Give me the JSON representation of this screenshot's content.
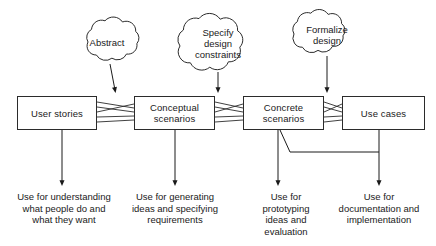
{
  "diagram": {
    "stroke_color": "#2b2b2b",
    "text_color": "#1a1a1a",
    "background_color": "#ffffff",
    "boxes": [
      {
        "id": "user-stories",
        "label": "User stories",
        "x": 17,
        "y": 96,
        "w": 80,
        "h": 34
      },
      {
        "id": "conceptual-scenarios",
        "label": "Conceptual\nscenarios",
        "x": 134,
        "y": 96,
        "w": 81,
        "h": 34
      },
      {
        "id": "concrete-scenarios",
        "label": "Concrete\nscenarios",
        "x": 243,
        "y": 96,
        "w": 81,
        "h": 34
      },
      {
        "id": "use-cases",
        "label": "Use cases",
        "x": 342,
        "y": 96,
        "w": 83,
        "h": 34
      }
    ],
    "clouds": [
      {
        "id": "abstract",
        "label": "Abstract",
        "cx": 107,
        "cy": 42,
        "rx": 35,
        "ry": 22
      },
      {
        "id": "specify-design",
        "label": "Specify\ndesign\nconstraints",
        "cx": 218,
        "cy": 43,
        "rx": 40,
        "ry": 29
      },
      {
        "id": "formalize-design",
        "label": "Formalize\ndesign",
        "cx": 327,
        "cy": 34,
        "rx": 36,
        "ry": 22
      }
    ],
    "captions": [
      {
        "id": "use-understanding",
        "text": "Use for understanding\nwhat people do and\nwhat they want",
        "cx": 62,
        "y": 191,
        "w": 128
      },
      {
        "id": "use-generating",
        "text": "Use for generating\nideas and specifying\nrequirements",
        "cx": 175,
        "y": 191,
        "w": 118
      },
      {
        "id": "use-prototyping",
        "text": "Use for\nprototyping\nideas and\nevaluation",
        "cx": 286,
        "y": 191,
        "w": 76
      },
      {
        "id": "use-documentation",
        "text": "Use for\ndocumentation and\nimplementation",
        "cx": 379,
        "y": 191,
        "w": 112
      }
    ],
    "connector_label": "many-to-many fan connector",
    "arrows": [
      {
        "id": "abstract-to-conceptual",
        "from": "abstract",
        "to": "conceptual-scenarios"
      },
      {
        "id": "specify-to-concrete",
        "from": "specify-design",
        "to": "concrete-scenarios"
      },
      {
        "id": "formalize-to-use-cases",
        "from": "formalize-design",
        "to": "use-cases"
      },
      {
        "id": "user-stories-to-caption",
        "from": "user-stories",
        "to": "use-understanding"
      },
      {
        "id": "conceptual-to-caption",
        "from": "conceptual-scenarios",
        "to": "use-generating"
      },
      {
        "id": "concrete-to-caption",
        "from": "concrete-scenarios",
        "to": "use-prototyping"
      },
      {
        "id": "use-cases-to-caption",
        "from": "use-cases",
        "to": "use-documentation"
      },
      {
        "id": "concrete-to-documentation-route",
        "from": "concrete-scenarios",
        "to": "use-documentation"
      }
    ]
  }
}
